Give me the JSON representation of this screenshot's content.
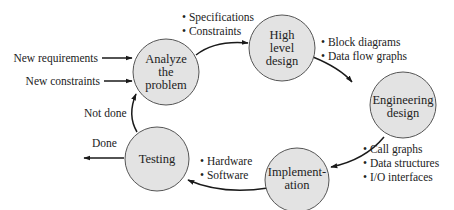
{
  "diagram": {
    "type": "cycle",
    "nodes": [
      {
        "id": "analyze",
        "lines": [
          "Analyze",
          "the",
          "problem"
        ]
      },
      {
        "id": "high_level_design",
        "lines": [
          "High",
          "level",
          "design"
        ]
      },
      {
        "id": "engineering_design",
        "lines": [
          "Engineering",
          "design"
        ]
      },
      {
        "id": "implementation",
        "lines": [
          "Implement-",
          "ation"
        ]
      },
      {
        "id": "testing",
        "lines": [
          "Testing"
        ]
      }
    ],
    "edges": [
      {
        "from": "analyze",
        "to": "high_level_design"
      },
      {
        "from": "high_level_design",
        "to": "engineering_design"
      },
      {
        "from": "engineering_design",
        "to": "implementation"
      },
      {
        "from": "implementation",
        "to": "testing"
      },
      {
        "from": "testing",
        "to": "analyze",
        "label": "Not done"
      },
      {
        "from": "testing",
        "to": "exit",
        "label": "Done"
      }
    ],
    "inputs": [
      {
        "label": "New requirements",
        "to": "analyze"
      },
      {
        "label": "New constraints",
        "to": "analyze"
      }
    ],
    "annotations": {
      "analyze_to_high": [
        "• Specifications",
        "• Constraints"
      ],
      "high_to_engineering": [
        "• Block diagrams",
        "• Data flow graphs"
      ],
      "engineering_to_implementation": [
        "• Call graphs",
        "• Data structures",
        "• I/O interfaces"
      ],
      "implementation_to_testing": [
        "• Hardware",
        "• Software"
      ]
    },
    "colors": {
      "node_fill": "#e3e3e3",
      "node_stroke": "#555555",
      "edge": "#1a1a1a"
    }
  }
}
